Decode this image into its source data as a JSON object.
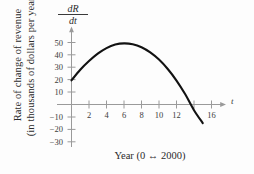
{
  "figure": {
    "caption": "Year (0 ↔ 2000)",
    "y_axis_label_line1": "Rate of change of revenue",
    "y_axis_label_line2": "(in thousands of dollars per year)",
    "dr_numerator": "dR",
    "dr_denominator": "dt",
    "x_axis_variable": "t",
    "background_color": "#fdfdfd",
    "curve_color": "#121212",
    "axis_color": "#9a9a9a",
    "text_color": "#2b2b2b"
  },
  "chart_data": {
    "type": "line",
    "title": "",
    "subtitle": "",
    "xlabel": "t",
    "ylabel": "dR/dt",
    "axis_label_long": "Rate of change of revenue (in thousands of dollars per year)",
    "caption": "Year (0 ↔ 2000)",
    "grid": false,
    "legend": "none",
    "xlim": [
      -0.6,
      17.2
    ],
    "ylim": [
      -33,
      55
    ],
    "xticks": [
      2,
      4,
      6,
      8,
      10,
      12,
      14,
      16
    ],
    "xtick_labels": [
      "2",
      "4",
      "6",
      "8",
      "10",
      "12",
      "",
      "16"
    ],
    "yticks": [
      50,
      40,
      30,
      20,
      10,
      -10,
      -20,
      -30
    ],
    "ytick_labels": [
      "50",
      "40",
      "30",
      "20",
      "10",
      "−10",
      "−20",
      "−30"
    ],
    "x_tick_note": "tick mark at 14 is drawn but its label is omitted because the curve crosses it",
    "series": [
      {
        "name": "dR/dt",
        "x": [
          0,
          1,
          2,
          3,
          4,
          5,
          6,
          7,
          8,
          9,
          10,
          11,
          12,
          13,
          14,
          15
        ],
        "values": [
          19.5,
          28.0,
          35.0,
          41.0,
          45.5,
          48.3,
          49.3,
          48.6,
          46.2,
          42.0,
          36.2,
          28.6,
          19.3,
          8.2,
          -4.6,
          -15.0
        ]
      }
    ],
    "annotations": {
      "start_point": [
        0,
        19.5
      ],
      "maximum": [
        6,
        49.3
      ],
      "zero_crossing": [
        13.7,
        0
      ],
      "end_point": [
        15,
        -15
      ]
    }
  }
}
